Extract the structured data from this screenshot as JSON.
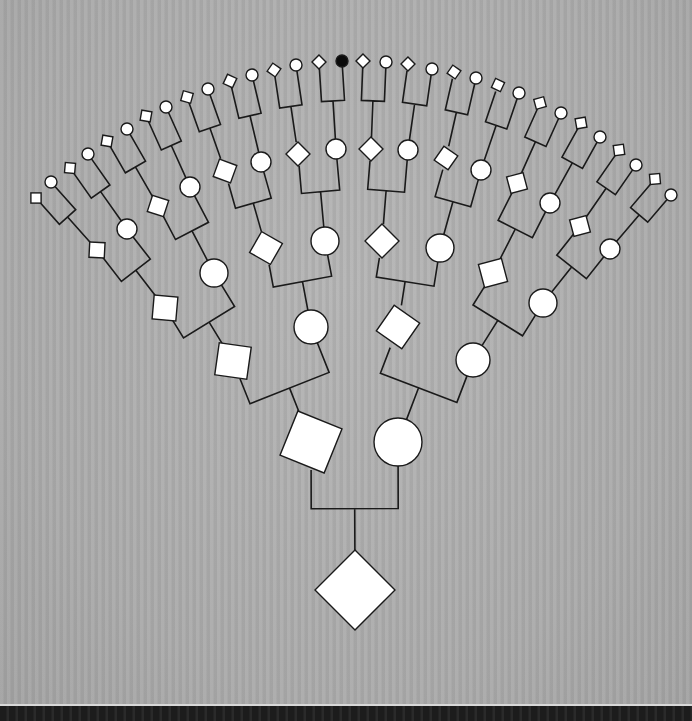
{
  "diagram": {
    "type": "pedigree-fan-chart",
    "generations": 6,
    "colors": {
      "background": "#aaaaaa",
      "node_fill": "#ffffff",
      "affected_fill": "#0a0a0a",
      "line": "#1a1a1a"
    },
    "legend_shapes": {
      "square": "male",
      "circle": "female",
      "diamond": "sex-unknown",
      "filled": "affected"
    },
    "nodes": [
      {
        "id": "g0-0",
        "gen": 0,
        "shape": "diamond",
        "x": 355,
        "y": 590,
        "r": 40
      },
      {
        "id": "g1-0",
        "gen": 1,
        "shape": "square",
        "x": 311,
        "y": 442,
        "r": 28,
        "rot": 22
      },
      {
        "id": "g1-1",
        "gen": 1,
        "shape": "circle",
        "x": 398,
        "y": 442,
        "r": 24
      },
      {
        "id": "g2-0",
        "gen": 2,
        "shape": "square",
        "x": 233,
        "y": 361,
        "r": 19,
        "rot": 8
      },
      {
        "id": "g2-1",
        "gen": 2,
        "shape": "circle",
        "x": 311,
        "y": 327,
        "r": 17
      },
      {
        "id": "g2-2",
        "gen": 2,
        "shape": "diamond",
        "x": 398,
        "y": 327,
        "r": 22,
        "rot": -10
      },
      {
        "id": "g2-3",
        "gen": 2,
        "shape": "circle",
        "x": 473,
        "y": 360,
        "r": 17
      },
      {
        "id": "g3-0",
        "gen": 3,
        "shape": "square",
        "x": 165,
        "y": 308,
        "r": 14,
        "rot": 5
      },
      {
        "id": "g3-1",
        "gen": 3,
        "shape": "circle",
        "x": 214,
        "y": 273,
        "r": 14
      },
      {
        "id": "g3-2",
        "gen": 3,
        "shape": "diamond",
        "x": 266,
        "y": 248,
        "r": 17,
        "rot": -15
      },
      {
        "id": "g3-3",
        "gen": 3,
        "shape": "circle",
        "x": 325,
        "y": 241,
        "r": 14
      },
      {
        "id": "g3-4",
        "gen": 3,
        "shape": "diamond",
        "x": 382,
        "y": 241,
        "r": 17,
        "rot": 0
      },
      {
        "id": "g3-5",
        "gen": 3,
        "shape": "circle",
        "x": 440,
        "y": 248,
        "r": 14
      },
      {
        "id": "g3-6",
        "gen": 3,
        "shape": "square",
        "x": 493,
        "y": 273,
        "r": 14,
        "rot": -15
      },
      {
        "id": "g3-7",
        "gen": 3,
        "shape": "circle",
        "x": 543,
        "y": 303,
        "r": 14
      },
      {
        "id": "g4-0",
        "gen": 4,
        "shape": "square",
        "x": 97,
        "y": 250,
        "r": 9,
        "rot": 3
      },
      {
        "id": "g4-1",
        "gen": 4,
        "shape": "circle",
        "x": 127,
        "y": 229,
        "r": 10
      },
      {
        "id": "g4-2",
        "gen": 4,
        "shape": "square",
        "x": 158,
        "y": 206,
        "r": 10,
        "rot": 18
      },
      {
        "id": "g4-3",
        "gen": 4,
        "shape": "circle",
        "x": 190,
        "y": 187,
        "r": 10
      },
      {
        "id": "g4-4",
        "gen": 4,
        "shape": "diamond",
        "x": 225,
        "y": 171,
        "r": 13,
        "rot": -25
      },
      {
        "id": "g4-5",
        "gen": 4,
        "shape": "circle",
        "x": 261,
        "y": 162,
        "r": 10
      },
      {
        "id": "g4-6",
        "gen": 4,
        "shape": "diamond",
        "x": 298,
        "y": 154,
        "r": 12,
        "rot": 0
      },
      {
        "id": "g4-7",
        "gen": 4,
        "shape": "circle",
        "x": 336,
        "y": 149,
        "r": 10
      },
      {
        "id": "g4-8",
        "gen": 4,
        "shape": "diamond",
        "x": 371,
        "y": 149,
        "r": 12,
        "rot": 0
      },
      {
        "id": "g4-9",
        "gen": 4,
        "shape": "circle",
        "x": 408,
        "y": 150,
        "r": 10
      },
      {
        "id": "g4-10",
        "gen": 4,
        "shape": "diamond",
        "x": 446,
        "y": 158,
        "r": 12,
        "rot": -10
      },
      {
        "id": "g4-11",
        "gen": 4,
        "shape": "circle",
        "x": 481,
        "y": 170,
        "r": 10
      },
      {
        "id": "g4-12",
        "gen": 4,
        "shape": "square",
        "x": 517,
        "y": 183,
        "r": 10,
        "rot": -15
      },
      {
        "id": "g4-13",
        "gen": 4,
        "shape": "circle",
        "x": 550,
        "y": 203,
        "r": 10
      },
      {
        "id": "g4-14",
        "gen": 4,
        "shape": "square",
        "x": 580,
        "y": 226,
        "r": 10,
        "rot": -15
      },
      {
        "id": "g4-15",
        "gen": 4,
        "shape": "circle",
        "x": 610,
        "y": 249,
        "r": 10
      },
      {
        "id": "g5-0",
        "gen": 5,
        "shape": "square",
        "x": 36,
        "y": 198,
        "r": 6,
        "rot": 0
      },
      {
        "id": "g5-1",
        "gen": 5,
        "shape": "circle",
        "x": 51,
        "y": 182,
        "r": 6
      },
      {
        "id": "g5-2",
        "gen": 5,
        "shape": "square",
        "x": 70,
        "y": 168,
        "r": 6,
        "rot": 5
      },
      {
        "id": "g5-3",
        "gen": 5,
        "shape": "circle",
        "x": 88,
        "y": 154,
        "r": 6
      },
      {
        "id": "g5-4",
        "gen": 5,
        "shape": "square",
        "x": 107,
        "y": 141,
        "r": 6,
        "rot": 10
      },
      {
        "id": "g5-5",
        "gen": 5,
        "shape": "circle",
        "x": 127,
        "y": 129,
        "r": 6
      },
      {
        "id": "g5-6",
        "gen": 5,
        "shape": "square",
        "x": 146,
        "y": 116,
        "r": 6,
        "rot": 10
      },
      {
        "id": "g5-7",
        "gen": 5,
        "shape": "circle",
        "x": 166,
        "y": 107,
        "r": 6
      },
      {
        "id": "g5-8",
        "gen": 5,
        "shape": "square",
        "x": 187,
        "y": 97,
        "r": 6,
        "rot": 15
      },
      {
        "id": "g5-9",
        "gen": 5,
        "shape": "circle",
        "x": 208,
        "y": 89,
        "r": 6
      },
      {
        "id": "g5-10",
        "gen": 5,
        "shape": "square",
        "x": 230,
        "y": 81,
        "r": 6,
        "rot": 25
      },
      {
        "id": "g5-11",
        "gen": 5,
        "shape": "circle",
        "x": 252,
        "y": 75,
        "r": 6
      },
      {
        "id": "g5-12",
        "gen": 5,
        "shape": "diamond",
        "x": 274,
        "y": 70,
        "r": 7,
        "rot": -10
      },
      {
        "id": "g5-13",
        "gen": 5,
        "shape": "circle",
        "x": 296,
        "y": 65,
        "r": 6
      },
      {
        "id": "g5-14",
        "gen": 5,
        "shape": "diamond",
        "x": 319,
        "y": 62,
        "r": 7,
        "rot": 0
      },
      {
        "id": "g5-15",
        "gen": 5,
        "shape": "circle",
        "x": 342,
        "y": 61,
        "r": 6,
        "affected": true
      },
      {
        "id": "g5-16",
        "gen": 5,
        "shape": "diamond",
        "x": 363,
        "y": 61,
        "r": 7,
        "rot": 0
      },
      {
        "id": "g5-17",
        "gen": 5,
        "shape": "circle",
        "x": 386,
        "y": 62,
        "r": 6
      },
      {
        "id": "g5-18",
        "gen": 5,
        "shape": "diamond",
        "x": 408,
        "y": 64,
        "r": 7,
        "rot": 0
      },
      {
        "id": "g5-19",
        "gen": 5,
        "shape": "circle",
        "x": 432,
        "y": 69,
        "r": 6
      },
      {
        "id": "g5-20",
        "gen": 5,
        "shape": "diamond",
        "x": 454,
        "y": 72,
        "r": 7,
        "rot": -10
      },
      {
        "id": "g5-21",
        "gen": 5,
        "shape": "circle",
        "x": 476,
        "y": 78,
        "r": 6
      },
      {
        "id": "g5-22",
        "gen": 5,
        "shape": "diamond",
        "x": 498,
        "y": 85,
        "r": 7,
        "rot": -20
      },
      {
        "id": "g5-23",
        "gen": 5,
        "shape": "circle",
        "x": 519,
        "y": 93,
        "r": 6
      },
      {
        "id": "g5-24",
        "gen": 5,
        "shape": "square",
        "x": 540,
        "y": 103,
        "r": 6,
        "rot": -15
      },
      {
        "id": "g5-25",
        "gen": 5,
        "shape": "circle",
        "x": 561,
        "y": 113,
        "r": 6
      },
      {
        "id": "g5-26",
        "gen": 5,
        "shape": "square",
        "x": 581,
        "y": 123,
        "r": 6,
        "rot": -10
      },
      {
        "id": "g5-27",
        "gen": 5,
        "shape": "circle",
        "x": 600,
        "y": 137,
        "r": 6
      },
      {
        "id": "g5-28",
        "gen": 5,
        "shape": "square",
        "x": 619,
        "y": 150,
        "r": 6,
        "rot": -8
      },
      {
        "id": "g5-29",
        "gen": 5,
        "shape": "circle",
        "x": 636,
        "y": 165,
        "r": 6
      },
      {
        "id": "g5-30",
        "gen": 5,
        "shape": "square",
        "x": 655,
        "y": 179,
        "r": 6,
        "rot": -5
      },
      {
        "id": "g5-31",
        "gen": 5,
        "shape": "circle",
        "x": 671,
        "y": 195,
        "r": 6
      }
    ]
  }
}
